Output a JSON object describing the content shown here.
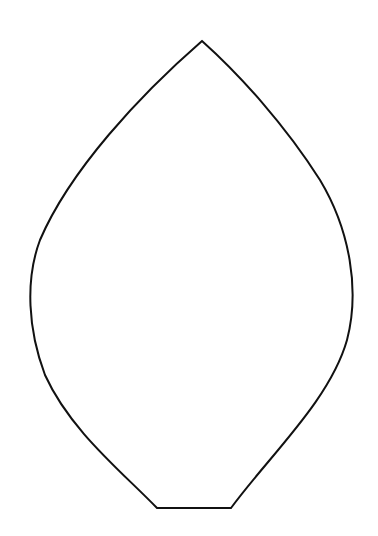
{
  "shape": {
    "type": "petal-outline",
    "stroke": "#111111",
    "fill": "#ffffff",
    "stroke_width": 2,
    "apex": [
      202,
      41
    ],
    "left_extreme": [
      30,
      300
    ],
    "right_extreme": [
      352,
      290
    ],
    "base": [
      [
        157,
        508
      ],
      [
        231,
        508
      ]
    ]
  }
}
